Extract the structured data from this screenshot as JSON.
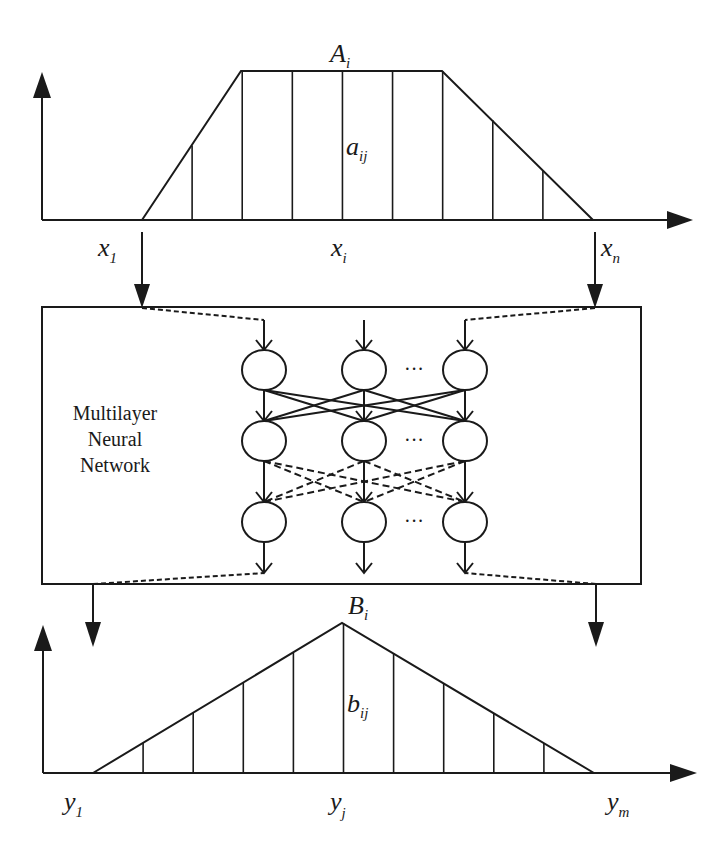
{
  "diagram": {
    "colors": {
      "ink": "#1a1a1a",
      "background": "#ffffff"
    },
    "input_set": {
      "name": "A",
      "name_sub": "i",
      "member_label": "a",
      "member_sub": "ij",
      "shape": "trapezoid",
      "axis_labels": [
        {
          "base": "x",
          "sub": "1"
        },
        {
          "base": "x",
          "sub": "i"
        },
        {
          "base": "x",
          "sub": "n"
        }
      ],
      "sample_memberships": [
        0,
        0.5,
        1,
        1,
        1,
        1,
        1,
        0.67,
        0.33,
        0
      ]
    },
    "network": {
      "label_lines": [
        "Multilayer",
        "Neural",
        "Network"
      ],
      "layers": 3,
      "nodes_per_layer_shown": 3,
      "ellipsis": "···",
      "connections": [
        {
          "from_layer": 1,
          "to_layer": 2,
          "style": "solid"
        },
        {
          "from_layer": 2,
          "to_layer": 3,
          "style": "dashed"
        }
      ]
    },
    "output_set": {
      "name": "B",
      "name_sub": "i",
      "member_label": "b",
      "member_sub": "ij",
      "shape": "triangle",
      "axis_labels": [
        {
          "base": "y",
          "sub": "1"
        },
        {
          "base": "y",
          "sub": "j"
        },
        {
          "base": "y",
          "sub": "m"
        }
      ],
      "sample_memberships": [
        0,
        0.2,
        0.4,
        0.6,
        0.8,
        1,
        0.8,
        0.6,
        0.4,
        0.2,
        0
      ]
    }
  }
}
